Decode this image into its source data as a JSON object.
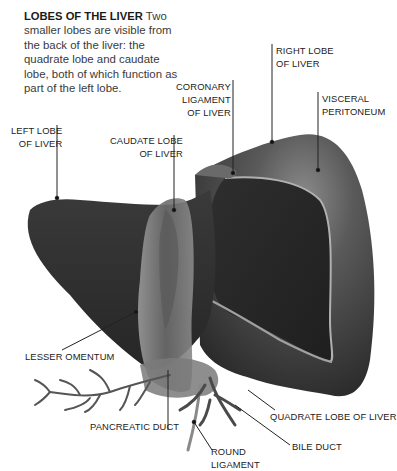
{
  "intro": {
    "title": "LOBES OF THE LIVER",
    "body": "Two smaller lobes are visible from the back of the liver: the quadrate lobe and caudate lobe, both of which function as part of the left lobe."
  },
  "labels": {
    "right_lobe": {
      "line1": "RIGHT LOBE",
      "line2": "OF LIVER"
    },
    "coronary": {
      "line1": "CORONARY",
      "line2": "LIGAMENT",
      "line3": "OF LIVER"
    },
    "visceral": {
      "line1": "VISCERAL",
      "line2": "PERITONEUM"
    },
    "left_lobe": {
      "line1": "LEFT LOBE",
      "line2": "OF LIVER"
    },
    "caudate": {
      "line1": "CAUDATE LOBE",
      "line2": "OF LIVER"
    },
    "lesser_omentum": "LESSER OMENTUM",
    "pancreatic_duct": "PANCREATIC DUCT",
    "quadrate": "QUADRATE LOBE OF LIVER",
    "bile_duct": "BILE DUCT",
    "round_ligament": {
      "line1": "ROUND",
      "line2": "LIGAMENT"
    }
  },
  "colors": {
    "liver_dark": "#2a2a2a",
    "liver_mid": "#4a4a4a",
    "liver_light": "#8a8a8a",
    "leader_line": "#222222"
  }
}
